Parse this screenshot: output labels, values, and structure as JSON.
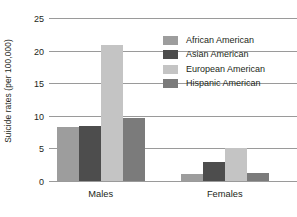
{
  "chart_data": {
    "type": "bar",
    "title": "",
    "xlabel": "",
    "ylabel": "Suicide rates (per 100,000)",
    "categories": [
      "Males",
      "Females"
    ],
    "series": [
      {
        "name": "African American",
        "color": "#9d9d9d",
        "values": [
          8.3,
          1.1
        ]
      },
      {
        "name": "Asian American",
        "color": "#4d4d4d",
        "values": [
          8.4,
          2.9
        ]
      },
      {
        "name": "European American",
        "color": "#c4c4c4",
        "values": [
          20.9,
          5.1
        ]
      },
      {
        "name": "Hispanic American",
        "color": "#7b7b7b",
        "values": [
          9.7,
          1.2
        ]
      }
    ],
    "ylim": [
      0,
      25
    ],
    "yticks": [
      0,
      5,
      10,
      15,
      20,
      25
    ],
    "ytick_labels": [
      "0",
      "5",
      "10",
      "15",
      "20",
      "25"
    ],
    "grid": true,
    "legend_position": "upper right"
  },
  "axis": {
    "y_title": "Suicide rates (per 100,000)",
    "tick_0": "0",
    "tick_5": "5",
    "tick_10": "10",
    "tick_15": "15",
    "tick_20": "20",
    "tick_25": "25"
  },
  "groups": {
    "males": "Males",
    "females": "Females"
  },
  "legend": {
    "item_0": "African American",
    "item_1": "Asian American",
    "item_2": "European American",
    "item_3": "Hispanic American"
  },
  "colors": {
    "african_american": "#9d9d9d",
    "asian_american": "#4d4d4d",
    "european_american": "#c4c4c4",
    "hispanic_american": "#7b7b7b",
    "gridline": "#9a9a9a",
    "text": "#231f20",
    "background": "#ffffff"
  }
}
